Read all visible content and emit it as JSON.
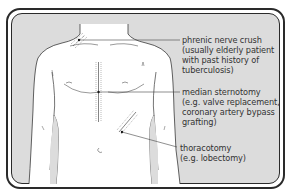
{
  "figure": {
    "type": "anatomical-diagram",
    "colors": {
      "background": "#dcdcdc",
      "body": "#ffffff",
      "outline": "#3a3a3a",
      "frame": "#2a2a2a",
      "text": "#333333"
    }
  },
  "annotations": [
    {
      "id": "phrenic-nerve-crush",
      "lines": [
        "phrenic nerve crush",
        "(usually elderly patient",
        "with past history of",
        "tuberculosis)"
      ]
    },
    {
      "id": "median-sternotomy",
      "lines": [
        "median sternotomy",
        "(e.g. valve replacement,",
        "coronary artery bypass",
        "grafting)"
      ]
    },
    {
      "id": "thoracotomy",
      "lines": [
        "thoracotomy",
        "(e.g. lobectomy)"
      ]
    }
  ]
}
